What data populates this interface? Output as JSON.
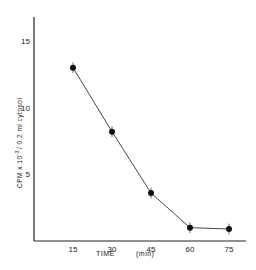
{
  "chart_data": {
    "type": "line",
    "title": "",
    "xlabel": "TIME (min)",
    "ylabel": "CPM x 10^-3 / 0.2 ml cytosol",
    "x": [
      15,
      30,
      45,
      60,
      75
    ],
    "series": [
      {
        "name": "CPM",
        "values": [
          13.0,
          8.2,
          3.6,
          1.0,
          0.9
        ],
        "errors": [
          0.4,
          0.4,
          0.4,
          0.4,
          0.4
        ],
        "marker": "filled-circle"
      }
    ],
    "xticks": [
      "15",
      "30",
      "45",
      "60",
      "75"
    ],
    "yticks": [
      "5",
      "10",
      "15"
    ],
    "xlim": [
      0,
      80
    ],
    "ylim": [
      0,
      18
    ],
    "grid": false,
    "legend": null
  },
  "labels": {
    "xlabel_main": "TIME",
    "xlabel_unit": "(min)",
    "ylabel_prefix": "CPM x 10",
    "ylabel_exp": "-3",
    "ylabel_suffix": "/ 0.2 ml cytosol"
  }
}
